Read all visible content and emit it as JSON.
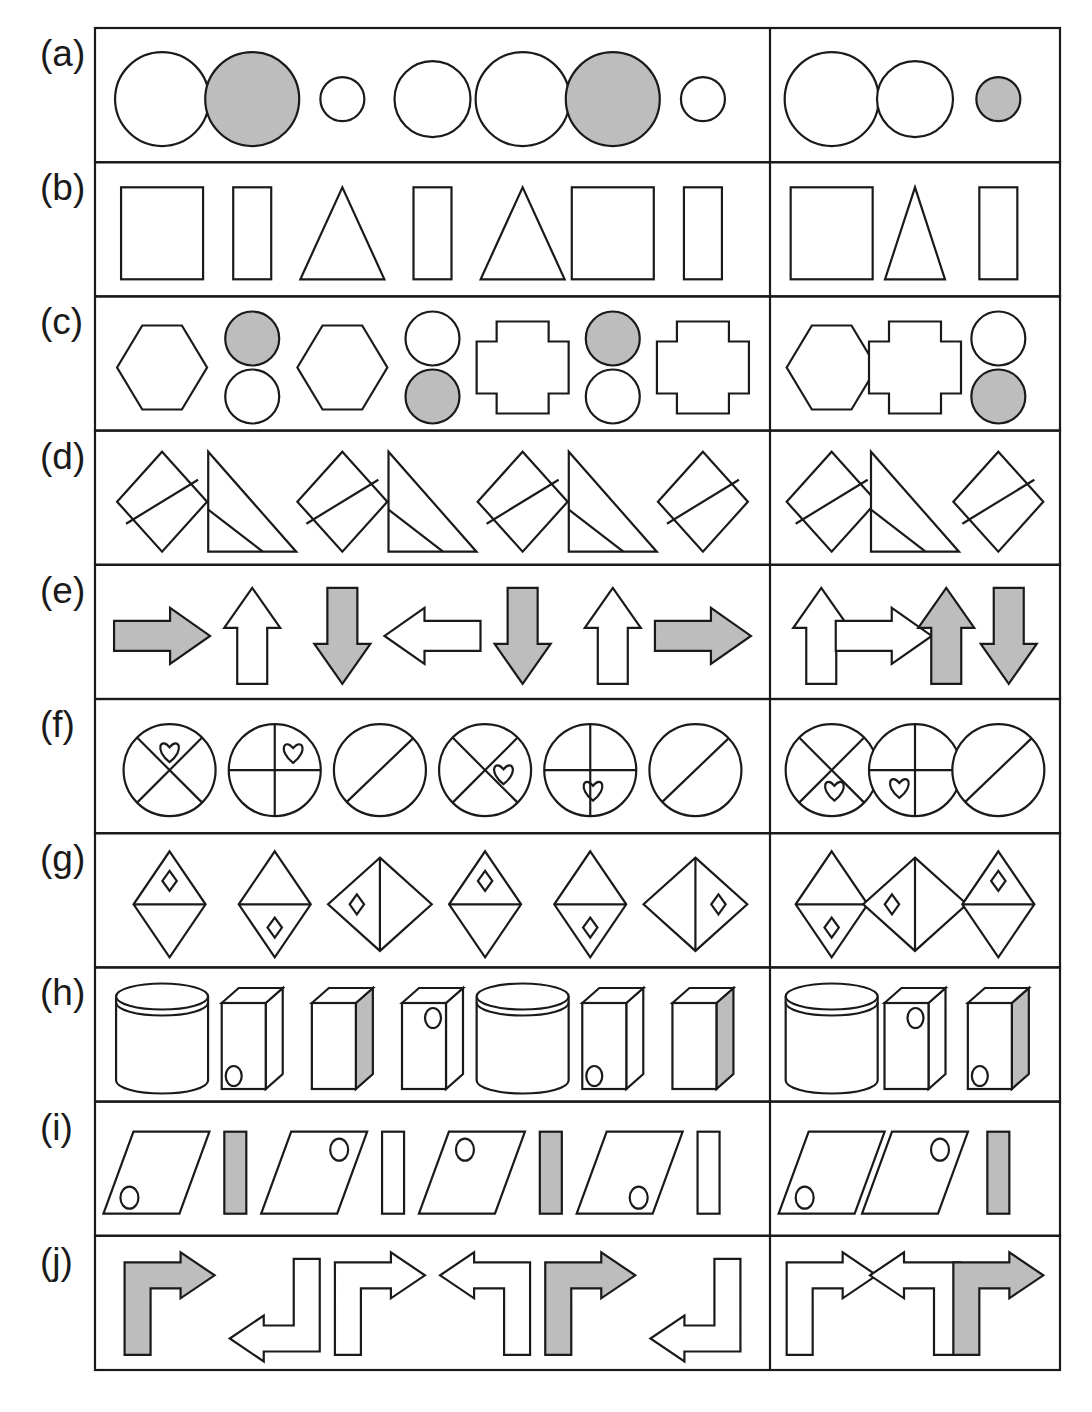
{
  "figure": {
    "type": "shape-sequence-panels",
    "row_labels": [
      "(a)",
      "(b)",
      "(c)",
      "(d)",
      "(e)",
      "(f)",
      "(g)",
      "(h)",
      "(i)",
      "(j)"
    ],
    "colors": {
      "stroke": "#1a1a1a",
      "fill_white": "#ffffff",
      "fill_gray": "#bdbdbd",
      "background": "#ffffff",
      "border": "#1a1a1a"
    },
    "geometry": {
      "table_left": 95,
      "table_right": 1060,
      "table_top": 28,
      "table_bottom": 1370,
      "divider_x": 770,
      "label_x": 40,
      "row_count": 10
    },
    "rows": [
      {
        "label": "(a)",
        "left": [
          {
            "kind": "circle",
            "size": "large",
            "fill": "white"
          },
          {
            "kind": "circle",
            "size": "large",
            "fill": "gray"
          },
          {
            "kind": "circle",
            "size": "small",
            "fill": "white"
          },
          {
            "kind": "circle",
            "size": "medium",
            "fill": "white"
          },
          {
            "kind": "circle",
            "size": "large",
            "fill": "white"
          },
          {
            "kind": "circle",
            "size": "large",
            "fill": "gray"
          },
          {
            "kind": "circle",
            "size": "small",
            "fill": "white"
          }
        ],
        "right": [
          {
            "kind": "circle",
            "size": "large",
            "fill": "white"
          },
          {
            "kind": "circle",
            "size": "medium",
            "fill": "white"
          },
          {
            "kind": "circle",
            "size": "small",
            "fill": "gray"
          }
        ]
      },
      {
        "label": "(b)",
        "left": [
          {
            "kind": "square",
            "size": "large",
            "fill": "white"
          },
          {
            "kind": "rect-tall",
            "size": "narrow",
            "fill": "white"
          },
          {
            "kind": "triangle",
            "size": "wide",
            "fill": "white"
          },
          {
            "kind": "rect-tall",
            "size": "narrow",
            "fill": "white"
          },
          {
            "kind": "triangle",
            "size": "wide",
            "fill": "white"
          },
          {
            "kind": "square",
            "size": "large",
            "fill": "white"
          },
          {
            "kind": "rect-tall",
            "size": "narrow",
            "fill": "white"
          }
        ],
        "right": [
          {
            "kind": "square",
            "size": "large",
            "fill": "white"
          },
          {
            "kind": "triangle",
            "size": "narrow",
            "fill": "white"
          },
          {
            "kind": "rect-tall",
            "size": "narrow",
            "fill": "white"
          }
        ]
      },
      {
        "label": "(c)",
        "left": [
          {
            "kind": "hexagon",
            "fill": "white"
          },
          {
            "kind": "two-circles",
            "top": "gray",
            "bottom": "white"
          },
          {
            "kind": "hexagon",
            "fill": "white"
          },
          {
            "kind": "two-circles",
            "top": "white",
            "bottom": "gray"
          },
          {
            "kind": "cross",
            "fill": "white"
          },
          {
            "kind": "two-circles",
            "top": "gray",
            "bottom": "white"
          },
          {
            "kind": "cross",
            "fill": "white"
          }
        ],
        "right": [
          {
            "kind": "hexagon",
            "fill": "white"
          },
          {
            "kind": "cross",
            "fill": "white"
          },
          {
            "kind": "two-circles",
            "top": "white",
            "bottom": "gray"
          }
        ]
      },
      {
        "label": "(d)",
        "left": [
          {
            "kind": "diamond-split",
            "fill": "white"
          },
          {
            "kind": "right-triangle",
            "fill": "white"
          },
          {
            "kind": "diamond-split",
            "fill": "white"
          },
          {
            "kind": "right-triangle",
            "fill": "white"
          },
          {
            "kind": "diamond-split",
            "fill": "white"
          },
          {
            "kind": "right-triangle",
            "fill": "white"
          },
          {
            "kind": "diamond-split",
            "fill": "white"
          }
        ],
        "right": [
          {
            "kind": "diamond-split",
            "fill": "white"
          },
          {
            "kind": "right-triangle",
            "fill": "white"
          },
          {
            "kind": "diamond-split",
            "fill": "white"
          }
        ]
      },
      {
        "label": "(e)",
        "left": [
          {
            "kind": "arrow",
            "dir": "right",
            "fill": "gray"
          },
          {
            "kind": "arrow",
            "dir": "up",
            "fill": "white"
          },
          {
            "kind": "arrow",
            "dir": "down",
            "fill": "gray"
          },
          {
            "kind": "arrow",
            "dir": "left",
            "fill": "white"
          },
          {
            "kind": "arrow",
            "dir": "down",
            "fill": "gray"
          },
          {
            "kind": "arrow",
            "dir": "up",
            "fill": "white"
          },
          {
            "kind": "arrow",
            "dir": "right",
            "fill": "gray"
          }
        ],
        "right": [
          {
            "kind": "arrow",
            "dir": "up",
            "fill": "white"
          },
          {
            "kind": "arrow",
            "dir": "right",
            "fill": "white"
          },
          {
            "kind": "arrow",
            "dir": "up",
            "fill": "gray"
          },
          {
            "kind": "arrow",
            "dir": "down",
            "fill": "gray"
          }
        ]
      },
      {
        "label": "(f)",
        "left": [
          {
            "kind": "circle-divided",
            "division": "x",
            "heart": "top"
          },
          {
            "kind": "circle-divided",
            "division": "plus",
            "heart": "top-right"
          },
          {
            "kind": "circle-divided",
            "division": "slash",
            "heart": "none"
          },
          {
            "kind": "circle-divided",
            "division": "x",
            "heart": "right"
          },
          {
            "kind": "circle-divided",
            "division": "plus",
            "heart": "bottom"
          },
          {
            "kind": "circle-divided",
            "division": "slash",
            "heart": "none"
          }
        ],
        "right": [
          {
            "kind": "circle-divided",
            "division": "x",
            "heart": "bottom"
          },
          {
            "kind": "circle-divided",
            "division": "plus",
            "heart": "bottom-left"
          },
          {
            "kind": "circle-divided",
            "division": "slash",
            "heart": "none"
          }
        ]
      },
      {
        "label": "(g)",
        "left": [
          {
            "kind": "kite",
            "division": "horizontal",
            "marker": "top"
          },
          {
            "kind": "kite",
            "division": "horizontal",
            "marker": "bottom"
          },
          {
            "kind": "kite",
            "division": "vertical",
            "marker": "left"
          },
          {
            "kind": "kite",
            "division": "horizontal",
            "marker": "top"
          },
          {
            "kind": "kite",
            "division": "horizontal",
            "marker": "bottom"
          },
          {
            "kind": "kite",
            "division": "vertical",
            "marker": "right"
          }
        ],
        "right": [
          {
            "kind": "kite",
            "division": "horizontal",
            "marker": "bottom"
          },
          {
            "kind": "kite",
            "division": "vertical",
            "marker": "left"
          },
          {
            "kind": "kite",
            "division": "horizontal",
            "marker": "top"
          }
        ]
      },
      {
        "label": "(h)",
        "left": [
          {
            "kind": "cylinder",
            "fill": "white"
          },
          {
            "kind": "box",
            "side": "white",
            "circle": "bottom-left"
          },
          {
            "kind": "box",
            "side": "gray",
            "circle": "none"
          },
          {
            "kind": "box",
            "side": "white",
            "circle": "top-right"
          },
          {
            "kind": "cylinder",
            "fill": "white"
          },
          {
            "kind": "box",
            "side": "white",
            "circle": "bottom-left"
          },
          {
            "kind": "box",
            "side": "gray",
            "circle": "none"
          }
        ],
        "right": [
          {
            "kind": "cylinder",
            "fill": "white"
          },
          {
            "kind": "box",
            "side": "white",
            "circle": "top-right"
          },
          {
            "kind": "box",
            "side": "gray",
            "circle": "bottom-left"
          }
        ]
      },
      {
        "label": "(i)",
        "left": [
          {
            "kind": "parallelogram",
            "circle": "bottom-left"
          },
          {
            "kind": "bar",
            "fill": "gray"
          },
          {
            "kind": "parallelogram",
            "circle": "top-right"
          },
          {
            "kind": "bar",
            "fill": "white"
          },
          {
            "kind": "parallelogram",
            "circle": "top-left"
          },
          {
            "kind": "bar",
            "fill": "gray"
          },
          {
            "kind": "parallelogram",
            "circle": "bottom-right"
          },
          {
            "kind": "bar",
            "fill": "white"
          }
        ],
        "right": [
          {
            "kind": "parallelogram",
            "circle": "bottom-left"
          },
          {
            "kind": "parallelogram",
            "circle": "top-right"
          },
          {
            "kind": "bar",
            "fill": "gray"
          }
        ]
      },
      {
        "label": "(j)",
        "left": [
          {
            "kind": "bent-arrow",
            "turn": "up-right",
            "fill": "gray"
          },
          {
            "kind": "bent-arrow",
            "turn": "down-left",
            "fill": "white"
          },
          {
            "kind": "bent-arrow",
            "turn": "up-right",
            "fill": "white"
          },
          {
            "kind": "bent-arrow",
            "turn": "up-left",
            "fill": "white"
          },
          {
            "kind": "bent-arrow",
            "turn": "up-right",
            "fill": "gray"
          },
          {
            "kind": "bent-arrow",
            "turn": "down-left",
            "fill": "white"
          }
        ],
        "right": [
          {
            "kind": "bent-arrow",
            "turn": "up-right",
            "fill": "white"
          },
          {
            "kind": "bent-arrow",
            "turn": "up-left",
            "fill": "white"
          },
          {
            "kind": "bent-arrow",
            "turn": "up-right",
            "fill": "gray"
          }
        ]
      }
    ]
  }
}
